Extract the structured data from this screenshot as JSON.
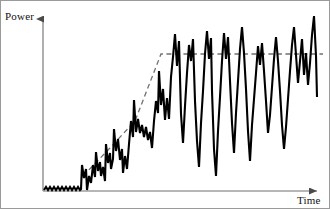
{
  "figure": {
    "background": "#ffffff",
    "border_color": "#9a9a9a"
  },
  "axes": {
    "y": {
      "label": "Power",
      "arrow_icon": "arrow-up-icon",
      "color": "#6e6e6e",
      "x_px": 42,
      "top_px": 14,
      "bottom_px": 190
    },
    "x": {
      "label": "Time",
      "arrow_icon": "arrow-right-icon",
      "color": "#6e6e6e",
      "y_px": 190,
      "left_px": 42,
      "right_px": 322
    }
  },
  "series": {
    "signal": {
      "name": "Power signal",
      "color": "#000000",
      "width_px": 2.1,
      "description": "noisy baseline, rising oscillation, high-amplitude plateau"
    },
    "trend": {
      "name": "Trend line",
      "color": "#707070",
      "width_px": 1.3,
      "dash": "5,3.5",
      "description": "ramp then saturation"
    }
  },
  "chart_data": {
    "type": "line",
    "title": "",
    "xlabel": "Time",
    "ylabel": "Power",
    "grid": false,
    "legend": null,
    "axis_arrows": true,
    "xlim": [
      42,
      322
    ],
    "ylim": [
      190,
      14
    ],
    "note": "Coordinates below are in pixel space of the 330x209 figure; x increases rightward, y decreases upward (y=190 is the baseline, y=14 is the top).",
    "series": [
      {
        "name": "Power signal",
        "style": "solid",
        "color": "#000000",
        "points": [
          [
            43,
            189
          ],
          [
            45,
            186
          ],
          [
            47,
            189
          ],
          [
            49,
            186
          ],
          [
            51,
            189
          ],
          [
            53,
            186
          ],
          [
            55,
            189
          ],
          [
            57,
            186
          ],
          [
            59,
            189
          ],
          [
            61,
            186
          ],
          [
            63,
            189
          ],
          [
            65,
            186
          ],
          [
            67,
            189
          ],
          [
            69,
            186
          ],
          [
            71,
            189
          ],
          [
            73,
            186
          ],
          [
            75,
            189
          ],
          [
            77,
            186
          ],
          [
            79,
            189
          ],
          [
            80,
            188
          ],
          [
            81,
            164
          ],
          [
            83,
            177
          ],
          [
            85,
            168
          ],
          [
            86,
            189
          ],
          [
            88,
            175
          ],
          [
            90,
            182
          ],
          [
            92,
            164
          ],
          [
            94,
            176
          ],
          [
            95,
            151
          ],
          [
            97,
            170
          ],
          [
            99,
            161
          ],
          [
            100,
            175
          ],
          [
            102,
            166
          ],
          [
            104,
            180
          ],
          [
            105,
            143
          ],
          [
            107,
            162
          ],
          [
            109,
            152
          ],
          [
            110,
            168
          ],
          [
            112,
            158
          ],
          [
            113,
            128
          ],
          [
            115,
            150
          ],
          [
            117,
            138
          ],
          [
            119,
            159
          ],
          [
            121,
            148
          ],
          [
            122,
            172
          ],
          [
            124,
            155
          ],
          [
            126,
            168
          ],
          [
            128,
            143
          ],
          [
            130,
            120
          ],
          [
            132,
            136
          ],
          [
            133,
            99
          ],
          [
            135,
            131
          ],
          [
            137,
            118
          ],
          [
            139,
            132
          ],
          [
            141,
            124
          ],
          [
            143,
            136
          ],
          [
            145,
            126
          ],
          [
            147,
            139
          ],
          [
            149,
            131
          ],
          [
            151,
            147
          ],
          [
            153,
            120
          ],
          [
            155,
            100
          ],
          [
            157,
            112
          ],
          [
            158,
            70
          ],
          [
            160,
            104
          ],
          [
            162,
            88
          ],
          [
            164,
            119
          ],
          [
            166,
            97
          ],
          [
            168,
            118
          ],
          [
            170,
            76
          ],
          [
            172,
            56
          ],
          [
            174,
            33
          ],
          [
            176,
            65
          ],
          [
            178,
            40
          ],
          [
            180,
            113
          ],
          [
            182,
            142
          ],
          [
            184,
            105
          ],
          [
            186,
            72
          ],
          [
            188,
            44
          ],
          [
            190,
            60
          ],
          [
            192,
            38
          ],
          [
            194,
            100
          ],
          [
            196,
            140
          ],
          [
            198,
            166
          ],
          [
            200,
            122
          ],
          [
            202,
            90
          ],
          [
            204,
            53
          ],
          [
            206,
            30
          ],
          [
            208,
            58
          ],
          [
            210,
            37
          ],
          [
            211,
            90
          ],
          [
            213,
            148
          ],
          [
            215,
            175
          ],
          [
            217,
            130
          ],
          [
            219,
            96
          ],
          [
            221,
            60
          ],
          [
            223,
            32
          ],
          [
            225,
            58
          ],
          [
            227,
            36
          ],
          [
            229,
            80
          ],
          [
            231,
            122
          ],
          [
            233,
            152
          ],
          [
            235,
            112
          ],
          [
            237,
            80
          ],
          [
            239,
            48
          ],
          [
            241,
            26
          ],
          [
            243,
            52
          ],
          [
            245,
            88
          ],
          [
            247,
            130
          ],
          [
            249,
            160
          ],
          [
            251,
            124
          ],
          [
            253,
            98
          ],
          [
            255,
            72
          ],
          [
            257,
            45
          ],
          [
            259,
            64
          ],
          [
            261,
            42
          ],
          [
            263,
            70
          ],
          [
            265,
            100
          ],
          [
            267,
            132
          ],
          [
            269,
            114
          ],
          [
            271,
            86
          ],
          [
            273,
            58
          ],
          [
            275,
            36
          ],
          [
            277,
            60
          ],
          [
            279,
            90
          ],
          [
            281,
            124
          ],
          [
            283,
            148
          ],
          [
            285,
            126
          ],
          [
            287,
            98
          ],
          [
            289,
            70
          ],
          [
            291,
            44
          ],
          [
            293,
            26
          ],
          [
            295,
            54
          ],
          [
            297,
            82
          ],
          [
            299,
            60
          ],
          [
            301,
            38
          ],
          [
            303,
            74
          ],
          [
            305,
            52
          ],
          [
            307,
            84
          ],
          [
            309,
            62
          ],
          [
            311,
            34
          ],
          [
            313,
            15
          ],
          [
            315,
            55
          ],
          [
            316,
            96
          ]
        ]
      },
      {
        "name": "Trend line",
        "style": "dashed",
        "color": "#707070",
        "points": [
          [
            82,
            175
          ],
          [
            108,
            148
          ],
          [
            134,
            120
          ],
          [
            160,
            53
          ],
          [
            200,
            53
          ],
          [
            250,
            53
          ],
          [
            322,
            53
          ]
        ]
      }
    ]
  }
}
